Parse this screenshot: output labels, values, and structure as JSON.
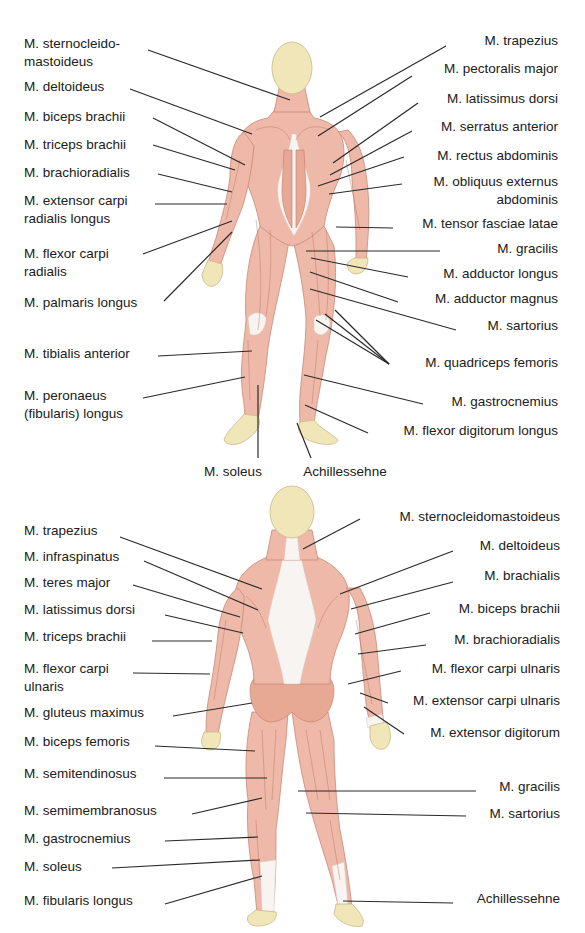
{
  "colors": {
    "background": "#ffffff",
    "muscle": "#eeb9a8",
    "muscle_dark": "#d9907c",
    "muscle_line": "#b86c5c",
    "tendon": "#f8f4f1",
    "skin_head": "#f1e6b8",
    "leader_line": "#2a2a2a",
    "label_text": "#202020"
  },
  "front_view": {
    "labels_left": [
      {
        "text": [
          "M. sternocleido-",
          "mastoideus"
        ],
        "x": 24,
        "y": 38,
        "anchor": [
          290,
          100
        ],
        "from": [
          148,
          50
        ]
      },
      {
        "text": [
          "M. deltoideus"
        ],
        "x": 24,
        "y": 81,
        "anchor": [
          252,
          134
        ],
        "from": [
          130,
          89
        ]
      },
      {
        "text": [
          "M. biceps brachii"
        ],
        "x": 24,
        "y": 111,
        "anchor": [
          245,
          165
        ],
        "from": [
          153,
          118
        ]
      },
      {
        "text": [
          "M. triceps brachii"
        ],
        "x": 24,
        "y": 139,
        "anchor": [
          235,
          170
        ],
        "from": [
          153,
          145
        ]
      },
      {
        "text": [
          "M. brachioradialis"
        ],
        "x": 24,
        "y": 167,
        "anchor": [
          232,
          192
        ],
        "from": [
          158,
          174
        ]
      },
      {
        "text": [
          "M. extensor carpi",
          "radialis longus"
        ],
        "x": 24,
        "y": 195,
        "anchor": [
          227,
          204
        ],
        "from": [
          155,
          204
        ]
      },
      {
        "text": [
          "M. flexor carpi",
          "radialis"
        ],
        "x": 24,
        "y": 248,
        "anchor": [
          232,
          221
        ],
        "from": [
          143,
          254
        ]
      },
      {
        "text": [
          "M. palmaris longus"
        ],
        "x": 24,
        "y": 297,
        "anchor": [
          232,
          232
        ],
        "from": [
          164,
          301
        ]
      },
      {
        "text": [
          "M. tibialis anterior"
        ],
        "x": 24,
        "y": 348,
        "anchor": [
          252,
          351
        ],
        "from": [
          158,
          356
        ]
      },
      {
        "text": [
          "M. peronaeus",
          "(fibularis) longus"
        ],
        "x": 24,
        "y": 390,
        "anchor": [
          245,
          377
        ],
        "from": [
          143,
          398
        ]
      }
    ],
    "labels_right": [
      {
        "text": [
          "M. trapezius"
        ],
        "xr": 558,
        "y": 35,
        "anchor": [
          320,
          117
        ],
        "from": [
          446,
          46
        ]
      },
      {
        "text": [
          "M. pectoralis major"
        ],
        "xr": 558,
        "y": 63,
        "anchor": [
          318,
          136
        ],
        "from": [
          412,
          76
        ]
      },
      {
        "text": [
          "M. latissimus dorsi"
        ],
        "xr": 558,
        "y": 93,
        "anchor": [
          333,
          163
        ],
        "from": [
          418,
          103
        ]
      },
      {
        "text": [
          "M. serratus anterior"
        ],
        "xr": 558,
        "y": 121,
        "anchor": [
          330,
          175
        ],
        "from": [
          412,
          131
        ]
      },
      {
        "text": [
          "M. rectus abdominis"
        ],
        "xr": 558,
        "y": 150,
        "anchor": [
          318,
          186
        ],
        "from": [
          404,
          157
        ]
      },
      {
        "text": [
          "M. obliquus externus",
          "abdominis"
        ],
        "xr": 558,
        "y": 176,
        "anchor": [
          329,
          194
        ],
        "from": [
          402,
          184
        ]
      },
      {
        "text": [
          "M. tensor fasciae latae"
        ],
        "xr": 558,
        "y": 218,
        "anchor": [
          336,
          227
        ],
        "from": [
          393,
          228
        ]
      },
      {
        "text": [
          "M. gracilis"
        ],
        "xr": 558,
        "y": 243,
        "anchor": [
          306,
          251
        ],
        "from": [
          440,
          251
        ]
      },
      {
        "text": [
          "M. adductor longus"
        ],
        "xr": 558,
        "y": 268,
        "anchor": [
          311,
          258
        ],
        "from": [
          408,
          277
        ]
      },
      {
        "text": [
          "M. adductor magnus"
        ],
        "xr": 558,
        "y": 293,
        "anchor": [
          310,
          272
        ],
        "from": [
          398,
          302
        ]
      },
      {
        "text": [
          "M. sartorius"
        ],
        "xr": 558,
        "y": 320,
        "anchor": [
          310,
          289
        ],
        "from": [
          456,
          330
        ]
      },
      {
        "text": [
          "M. quadriceps femoris"
        ],
        "xr": 558,
        "y": 357,
        "anchor_multi": [
          [
            325,
            314
          ],
          [
            335,
            310
          ],
          [
            316,
            320
          ]
        ],
        "from": [
          389,
          364
        ]
      },
      {
        "text": [
          "M. gastrocnemius"
        ],
        "xr": 558,
        "y": 396,
        "anchor": [
          304,
          375
        ],
        "from": [
          423,
          404
        ]
      },
      {
        "text": [
          "M. flexor digitorum longus"
        ],
        "xr": 558,
        "y": 425,
        "anchor": [
          305,
          405
        ],
        "from": [
          368,
          433
        ]
      }
    ],
    "labels_bottom": [
      {
        "text": [
          "M. soleus"
        ],
        "cx": 233,
        "y": 466,
        "anchor": [
          258,
          385
        ],
        "from": [
          258,
          458
        ]
      },
      {
        "text": [
          "Achillessehne"
        ],
        "cx": 345,
        "y": 466,
        "anchor": [
          297,
          423
        ],
        "from": [
          311,
          458
        ]
      }
    ]
  },
  "back_view": {
    "labels_left": [
      {
        "text": [
          "M. trapezius"
        ],
        "x": 24,
        "y": 525,
        "anchor": [
          262,
          589
        ],
        "from": [
          120,
          537
        ]
      },
      {
        "text": [
          "M. infraspinatus"
        ],
        "x": 24,
        "y": 551,
        "anchor": [
          258,
          610
        ],
        "from": [
          144,
          561
        ]
      },
      {
        "text": [
          "M. teres major"
        ],
        "x": 24,
        "y": 577,
        "anchor": [
          240,
          617
        ],
        "from": [
          133,
          585
        ]
      },
      {
        "text": [
          "M. latissimus dorsi"
        ],
        "x": 24,
        "y": 604,
        "anchor": [
          243,
          633
        ],
        "from": [
          165,
          615
        ]
      },
      {
        "text": [
          "M. triceps brachii"
        ],
        "x": 24,
        "y": 631,
        "anchor": [
          212,
          641
        ],
        "from": [
          152,
          641
        ]
      },
      {
        "text": [
          "M. flexor carpi",
          "ulnaris"
        ],
        "x": 24,
        "y": 663,
        "anchor": [
          210,
          674
        ],
        "from": [
          133,
          673
        ]
      },
      {
        "text": [
          "M. gluteus maximus"
        ],
        "x": 24,
        "y": 707,
        "anchor": [
          252,
          703
        ],
        "from": [
          173,
          716
        ]
      },
      {
        "text": [
          "M. biceps femoris"
        ],
        "x": 24,
        "y": 736,
        "anchor": [
          255,
          751
        ],
        "from": [
          155,
          746
        ]
      },
      {
        "text": [
          "M. semitendinosus"
        ],
        "x": 24,
        "y": 768,
        "anchor": [
          267,
          778
        ],
        "from": [
          164,
          778
        ]
      },
      {
        "text": [
          "M. semimembranosus"
        ],
        "x": 24,
        "y": 805,
        "anchor": [
          262,
          798
        ],
        "from": [
          192,
          814
        ]
      },
      {
        "text": [
          "M. gastrocnemius"
        ],
        "x": 24,
        "y": 833,
        "anchor": [
          258,
          837
        ],
        "from": [
          165,
          841
        ]
      },
      {
        "text": [
          "M. soleus"
        ],
        "x": 24,
        "y": 861,
        "anchor": [
          260,
          860
        ],
        "from": [
          112,
          868
        ]
      },
      {
        "text": [
          "M. fibularis longus"
        ],
        "x": 24,
        "y": 895,
        "anchor": [
          262,
          876
        ],
        "from": [
          165,
          904
        ]
      }
    ],
    "labels_right": [
      {
        "text": [
          "M. sternocleidomastoideus"
        ],
        "xr": 560,
        "y": 511,
        "anchor": [
          303,
          549
        ],
        "from": [
          360,
          519
        ]
      },
      {
        "text": [
          "M. deltoideus"
        ],
        "xr": 560,
        "y": 540,
        "anchor": [
          340,
          594
        ],
        "from": [
          453,
          551
        ]
      },
      {
        "text": [
          "M. brachialis"
        ],
        "xr": 560,
        "y": 570,
        "anchor": [
          351,
          609
        ],
        "from": [
          453,
          582
        ]
      },
      {
        "text": [
          "M. biceps brachii"
        ],
        "xr": 560,
        "y": 603,
        "anchor": [
          355,
          634
        ],
        "from": [
          430,
          613
        ]
      },
      {
        "text": [
          "M. brachioradialis"
        ],
        "xr": 560,
        "y": 634,
        "anchor": [
          358,
          654
        ],
        "from": [
          426,
          645
        ]
      },
      {
        "text": [
          "M. flexor carpi ulnaris"
        ],
        "xr": 560,
        "y": 663,
        "anchor": [
          348,
          684
        ],
        "from": [
          401,
          671
        ]
      },
      {
        "text": [
          "M. extensor carpi ulnaris"
        ],
        "xr": 560,
        "y": 695,
        "anchor": [
          360,
          693
        ],
        "from": [
          388,
          703
        ]
      },
      {
        "text": [
          "M. extensor digitorum"
        ],
        "xr": 560,
        "y": 727,
        "anchor": [
          364,
          707
        ],
        "from": [
          404,
          734
        ]
      },
      {
        "text": [
          "M. gracilis"
        ],
        "xr": 560,
        "y": 781,
        "anchor": [
          298,
          791
        ],
        "from": [
          476,
          791
        ]
      },
      {
        "text": [
          "M. sartorius"
        ],
        "xr": 560,
        "y": 808,
        "anchor": [
          306,
          813
        ],
        "from": [
          466,
          816
        ]
      },
      {
        "text": [
          "Achillessehne"
        ],
        "xr": 560,
        "y": 893,
        "anchor": [
          343,
          901
        ],
        "from": [
          453,
          903
        ]
      }
    ]
  }
}
